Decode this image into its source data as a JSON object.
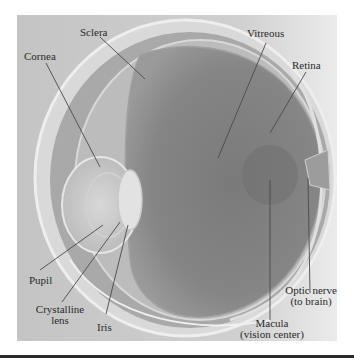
{
  "figure": {
    "labels": {
      "sclera": "Sclera",
      "cornea": "Cornea",
      "vitreous": "Vitreous",
      "retina": "Retina",
      "pupil": "Pupil",
      "lens_line1": "Crystalline",
      "lens_line2": "lens",
      "iris": "Iris",
      "macula_line1": "Macula",
      "macula_line2": "(vision center)",
      "optic_line1": "Optic nerve",
      "optic_line2": "(to brain)"
    },
    "colors": {
      "background": "#ffffff",
      "panel": "#c9c9c9",
      "vitreous": "#7f7f7f",
      "sclera_outer": "#e4e4e4",
      "leader_line": "#4a4a4a",
      "rule": "#2b2b2b"
    }
  }
}
